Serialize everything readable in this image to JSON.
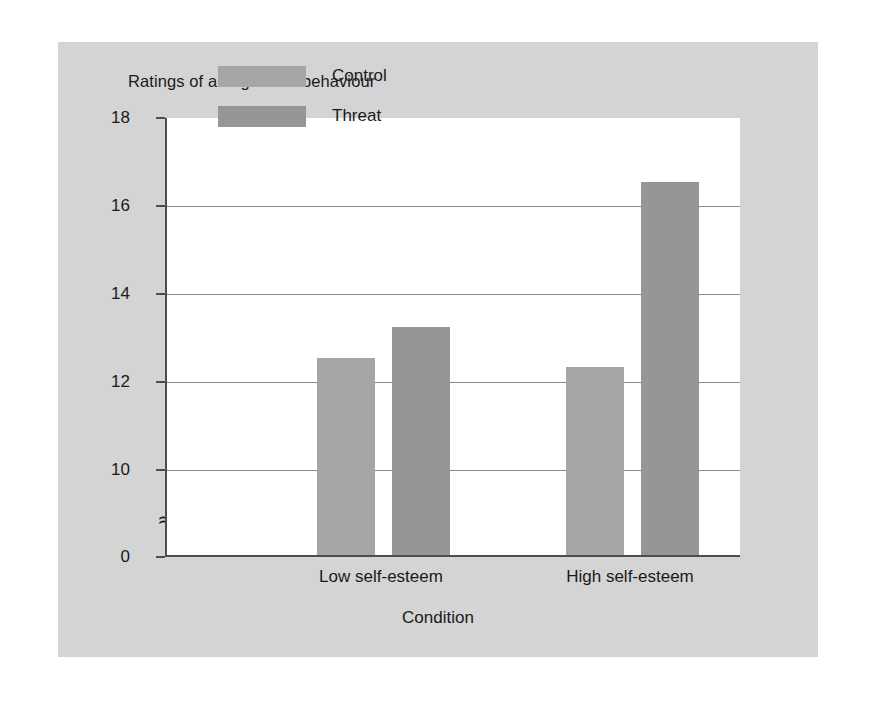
{
  "chart_data": {
    "type": "bar",
    "title": "Ratings of antagonistic behaviour",
    "xlabel": "Condition",
    "ylabel": "",
    "categories": [
      "Low self-esteem",
      "High self-esteem"
    ],
    "series": [
      {
        "name": "Control",
        "values": [
          12.5,
          12.3
        ],
        "color": "#a6a6a6"
      },
      {
        "name": "Threat",
        "values": [
          13.2,
          16.5
        ],
        "color": "#969696"
      }
    ],
    "ylim": [
      0,
      18
    ],
    "yticks": [
      0,
      10,
      12,
      14,
      16,
      18
    ],
    "ytick_labels": [
      "0",
      "10",
      "12",
      "14",
      "16",
      "18"
    ],
    "axis_break": {
      "present": true,
      "symbol": "≈",
      "between": [
        0,
        10
      ]
    },
    "grid": "horizontal",
    "gridlines_at": [
      10,
      12,
      14,
      16
    ],
    "legend": {
      "position": "top-left-inside",
      "entries": [
        "Control",
        "Threat"
      ]
    },
    "background_color": "#d4d4d4",
    "plot_background_color": "#ffffff",
    "axis_color": "#4d4d4d",
    "grid_color": "#8a8a8a",
    "text_color": "#1a1a1a"
  }
}
